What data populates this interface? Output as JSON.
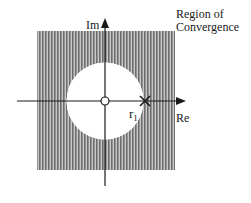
{
  "diagram": {
    "title_line1": "Region of",
    "title_line2": "Convergence",
    "axis_imag_label": "Im",
    "axis_real_label": "Re",
    "pole_label_main": "r",
    "pole_label_sub": "1",
    "colors": {
      "stripe_dark": "#6e6e6e",
      "stripe_light": "#c9c9c9",
      "axis": "#1a1a1a",
      "background": "#ffffff"
    },
    "elements": {
      "roc_region": "shaded square outside circle of radius r1",
      "zero": "open circle at origin",
      "pole": "cross at r1 on real axis"
    }
  }
}
